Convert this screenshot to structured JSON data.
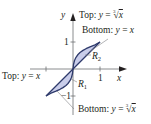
{
  "diagram": {
    "type": "area-between-curves",
    "curves": [
      {
        "name": "cube-root",
        "expression": "y = ∛x"
      },
      {
        "name": "identity",
        "expression": "y = x"
      }
    ],
    "regions": [
      {
        "label": "R",
        "subscript": "1",
        "x_range": [
          -1,
          0
        ]
      },
      {
        "label": "R",
        "subscript": "2",
        "x_range": [
          0,
          1
        ]
      }
    ],
    "colors": {
      "fill": "#c9cdea",
      "curve_stroke": "#2e3a6b",
      "axis": "#6d6e71",
      "text": "#231f20",
      "leader_line": "#808285"
    }
  },
  "axes": {
    "x_label": "x",
    "y_label": "y",
    "x_ticks": {
      "pos": "1",
      "neg": ""
    },
    "y_ticks": {
      "pos": "1",
      "neg": "−1"
    }
  },
  "annotations": {
    "top_right": {
      "prefix": "Top: ",
      "var": "y",
      "eq": " = ",
      "root_index": "3",
      "radical": "√",
      "radicand": "x"
    },
    "bottom_right_upper": {
      "prefix": "Bottom: ",
      "var": "y",
      "eq": " = ",
      "rhs": "x"
    },
    "top_left": {
      "prefix": "Top: ",
      "var": "y",
      "eq": " = ",
      "rhs": "x"
    },
    "bottom_right_lower": {
      "prefix": "Bottom: ",
      "var": "y",
      "eq": " = ",
      "root_index": "3",
      "radical": "√",
      "radicand": "x"
    },
    "r1": {
      "letter": "R",
      "sub": "1"
    },
    "r2": {
      "letter": "R",
      "sub": "2"
    }
  }
}
